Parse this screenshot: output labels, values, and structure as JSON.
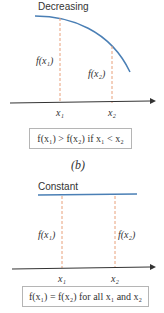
{
  "panel_b": {
    "title": "Decreasing",
    "label_f1": "f(x₁)",
    "label_f2": "f(x₂)",
    "tick_x1": "x₁",
    "tick_x2": "x₂",
    "condition": "f(x₁) > f(x₂) if x₁ < x₂",
    "caption": "(b)"
  },
  "panel_c": {
    "title": "Constant",
    "label_f1": "f(x₁)",
    "label_f2": "f(x₂)",
    "tick_x1": "x₁",
    "tick_x2": "x₂",
    "condition": "f(x₁) = f(x₂) for all x₁ and x₂"
  },
  "colors": {
    "curve": "#4a7fb5",
    "dashed": "#e8a07a",
    "axis": "#333333",
    "box_border": "#b5b5b5"
  }
}
